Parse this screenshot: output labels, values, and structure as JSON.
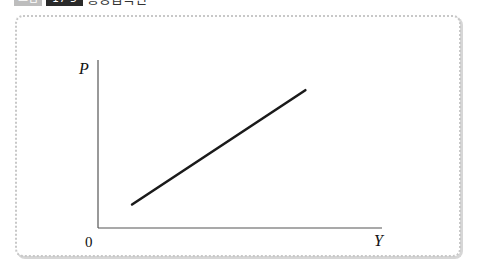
{
  "caption": {
    "label": "그림",
    "number": "17-5",
    "title": "총공급곡선"
  },
  "chart_data": {
    "type": "line",
    "title": "",
    "xlabel": "Y",
    "ylabel": "P",
    "origin_label": "0",
    "grid": false,
    "legend": null,
    "series": [
      {
        "name": "Aggregate supply (upward-sloping line)",
        "points": [
          {
            "x": 0.12,
            "y": 0.14
          },
          {
            "x": 0.73,
            "y": 0.82
          }
        ]
      }
    ],
    "xlim": [
      0,
      1
    ],
    "ylim": [
      0,
      1
    ],
    "ticks": []
  },
  "colors": {
    "line": "#1a1a1a",
    "axis": "#555555",
    "frame": "#c8c8c8"
  }
}
